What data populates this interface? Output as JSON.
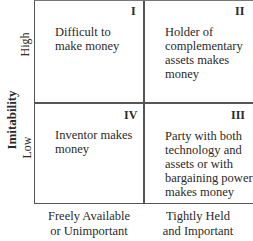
{
  "y_axis": {
    "title": "Imitability",
    "high": "High",
    "low": "Low"
  },
  "x_axis": {
    "left": "Freely Available or Unimportant",
    "left_line1": "Freely Available",
    "left_line2": "or Unimportant",
    "right_line1": "Tightly Held",
    "right_line2": "and Important"
  },
  "quadrants": [
    {
      "id": "I",
      "lines": [
        "Difficult to",
        "make money"
      ]
    },
    {
      "id": "II",
      "lines": [
        "Holder of",
        "complementary",
        "assets makes",
        "money"
      ]
    },
    {
      "id": "IV",
      "lines": [
        "Inventor makes",
        "money"
      ]
    },
    {
      "id": "III",
      "lines": [
        "Party with both",
        "technology and",
        "assets or with",
        "bargaining power",
        "makes money"
      ]
    }
  ]
}
